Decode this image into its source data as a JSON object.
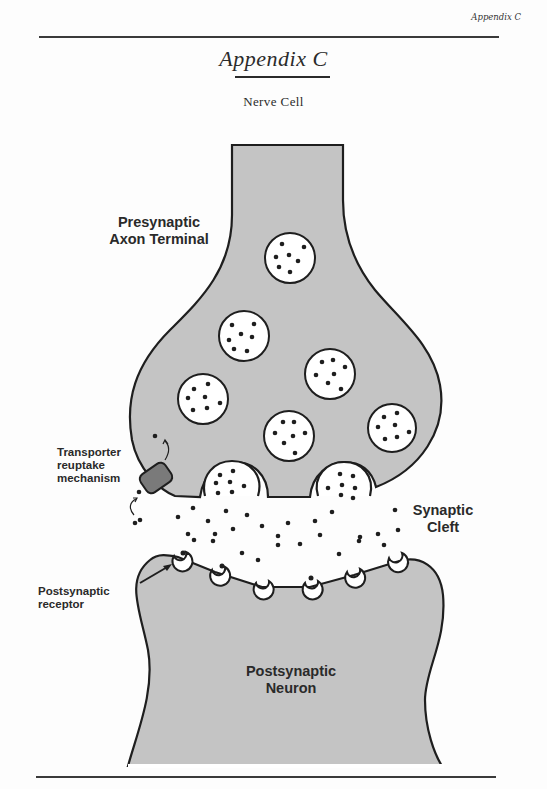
{
  "page": {
    "running_head": "Appendix C",
    "title": "Appendix C",
    "subtitle": "Nerve Cell"
  },
  "diagram": {
    "labels": {
      "presynaptic_line1": "Presynaptic",
      "presynaptic_line2": "Axon Terminal",
      "transporter_line1": "Transporter",
      "transporter_line2": "reuptake",
      "transporter_line3": "mechanism",
      "cleft_line1": "Synaptic",
      "cleft_line2": "Cleft",
      "receptor_line1": "Postsynaptic",
      "receptor_line2": "receptor",
      "neuron_line1": "Postsynaptic",
      "neuron_line2": "Neuron"
    },
    "colors": {
      "cell_fill": "#c4c4c4",
      "outline": "#1e1e1e",
      "vesicle_fill": "#ffffff",
      "transporter_fill": "#7a7a7a"
    },
    "vesicle_count": 9,
    "receptor_count": 7
  }
}
